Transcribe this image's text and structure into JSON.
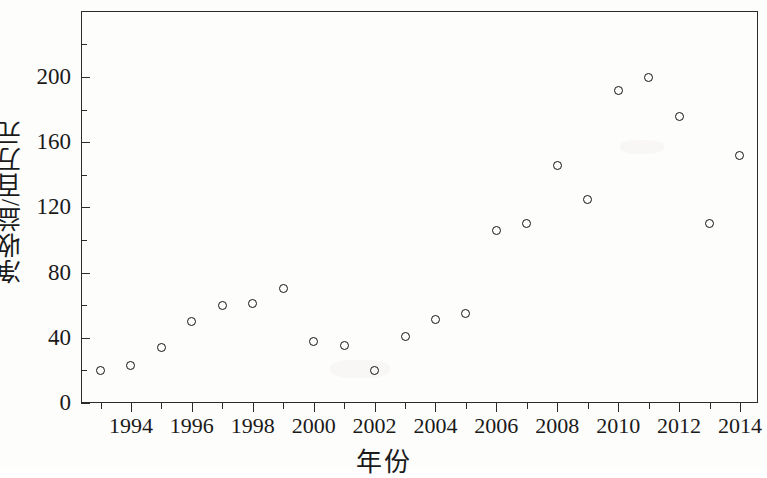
{
  "chart_data": {
    "type": "scatter",
    "title": "",
    "xlabel": "年份",
    "ylabel": "净收益/百万元",
    "x": [
      1993,
      1994,
      1995,
      1996,
      1997,
      1998,
      1999,
      2000,
      2001,
      2002,
      2003,
      2004,
      2005,
      2006,
      2007,
      2008,
      2009,
      2010,
      2011,
      2012,
      2013,
      2014
    ],
    "values": [
      20,
      23,
      34,
      50,
      60,
      61,
      70,
      38,
      35,
      20,
      41,
      51,
      55,
      106,
      110,
      146,
      125,
      192,
      200,
      176,
      110,
      152
    ],
    "series": [
      {
        "name": "净收益",
        "points": [
          {
            "x": 1993,
            "y": 20
          },
          {
            "x": 1994,
            "y": 23
          },
          {
            "x": 1995,
            "y": 34
          },
          {
            "x": 1996,
            "y": 50
          },
          {
            "x": 1997,
            "y": 60
          },
          {
            "x": 1998,
            "y": 61
          },
          {
            "x": 1999,
            "y": 70
          },
          {
            "x": 2000,
            "y": 38
          },
          {
            "x": 2001,
            "y": 35
          },
          {
            "x": 2002,
            "y": 20
          },
          {
            "x": 2003,
            "y": 41
          },
          {
            "x": 2004,
            "y": 51
          },
          {
            "x": 2005,
            "y": 55
          },
          {
            "x": 2006,
            "y": 106
          },
          {
            "x": 2007,
            "y": 110
          },
          {
            "x": 2008,
            "y": 146
          },
          {
            "x": 2009,
            "y": 125
          },
          {
            "x": 2010,
            "y": 192
          },
          {
            "x": 2011,
            "y": 200
          },
          {
            "x": 2012,
            "y": 176
          },
          {
            "x": 2013,
            "y": 110
          },
          {
            "x": 2014,
            "y": 152
          }
        ]
      }
    ],
    "xlim": [
      1992.3,
      1992.3
    ],
    "ylim": [
      0,
      240
    ],
    "xticks": [
      1994,
      1996,
      1998,
      2000,
      2002,
      2004,
      2006,
      2008,
      2010,
      2012,
      2014
    ],
    "xtick_labels": [
      "1994",
      "1996",
      "1998",
      "2000",
      "2002",
      "2004",
      "2006",
      "2008",
      "2010",
      "2012",
      "2014"
    ],
    "yticks": [
      0,
      40,
      80,
      120,
      160,
      200
    ],
    "ytick_labels": [
      "0",
      "40",
      "80",
      "120",
      "160",
      "200"
    ],
    "grid": false,
    "legend": "none",
    "marker": "open-circle",
    "marker_color": "#121212"
  },
  "axes": {
    "y_title": "净收益/百万元",
    "x_title": "年份"
  }
}
